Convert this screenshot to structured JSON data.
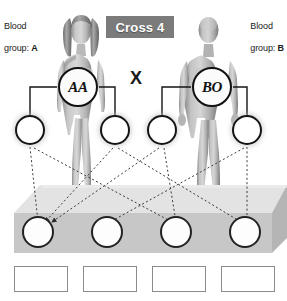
{
  "title": {
    "banner_label": "Cross 4"
  },
  "parents": {
    "mother": {
      "blood_label_line1": "Blood",
      "blood_label_line2": "group:",
      "blood_group": "A",
      "genotype": "AA",
      "figure_name": "female-parent-figure"
    },
    "father": {
      "blood_label_line1": "Blood",
      "blood_label_line2": "group:",
      "blood_group": "B",
      "genotype": "BO",
      "figure_name": "male-parent-figure"
    },
    "cross_symbol": "X"
  },
  "gametes": [
    {
      "label": "",
      "x": 30,
      "y": 130
    },
    {
      "label": "",
      "x": 115,
      "y": 130
    },
    {
      "label": "",
      "x": 162,
      "y": 130
    },
    {
      "label": "",
      "x": 247,
      "y": 130
    }
  ],
  "offspring": [
    {
      "label": "",
      "x": 38,
      "y": 232
    },
    {
      "label": "",
      "x": 107,
      "y": 232
    },
    {
      "label": "",
      "x": 176,
      "y": 232
    },
    {
      "label": "",
      "x": 245,
      "y": 232
    }
  ],
  "answer_boxes": [
    {
      "value": "",
      "x": 14
    },
    {
      "value": "",
      "x": 83
    },
    {
      "value": "",
      "x": 152
    },
    {
      "value": "",
      "x": 221
    }
  ],
  "colors": {
    "banner_bg": "#7b7b7b",
    "banner_text": "#ffffff",
    "platform_top": "#dedede",
    "platform_face": "#c6c6c6",
    "outline": "#151515",
    "box_border": "#8b8b8b",
    "text": "#1a1a1a"
  }
}
